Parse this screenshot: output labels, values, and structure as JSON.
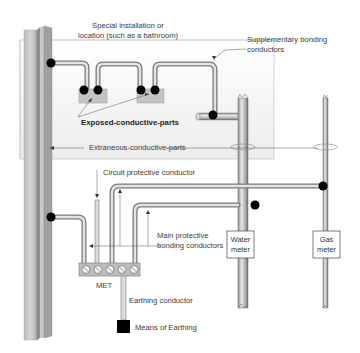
{
  "diagram": {
    "labels": {
      "special_location_line1": "Special installation or",
      "special_location_line2": "location (such as a bathroom)",
      "supplementary_line1": "Supplementary bonding",
      "supplementary_line2": "conductors",
      "exposed_parts": "Exposed-conductive-parts",
      "extraneous_parts": "Extraneous-conductive-parts",
      "cpc": "Circuit protective conductor",
      "main_bonding_line1": "Main protective",
      "main_bonding_line2": "bonding conductors",
      "met": "MET",
      "earthing_conductor": "Earthing conductor",
      "means_of_earthing": "Means of Earthing",
      "water_meter_line1": "Water",
      "water_meter_line2": "meter",
      "gas_meter_line1": "Gas",
      "gas_meter_line2": "meter"
    },
    "colors": {
      "pipe_light": "#d8d8d8",
      "pipe_mid": "#a9a9a9",
      "pipe_dark": "#6e6e6e",
      "box_fill": "#c9c9c9",
      "location_fill": "#f4f4f4",
      "junction": "#000000",
      "earth_block": "#000000",
      "text": "#3a3a3a"
    },
    "met_terminals": 5
  }
}
